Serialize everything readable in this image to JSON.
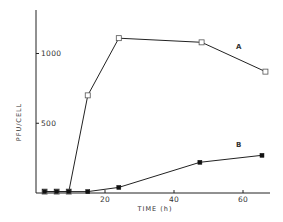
{
  "chart_data": {
    "type": "line",
    "title": "",
    "xlabel": "TIME (h)",
    "ylabel": "PFU/CELL",
    "xlim": [
      0,
      70
    ],
    "ylim": [
      0,
      1200
    ],
    "xticks": [
      20,
      40,
      60
    ],
    "xtick_labels": [
      "20",
      "40",
      "60"
    ],
    "yticks": [
      500,
      1000
    ],
    "ytick_labels": [
      "500",
      "1000"
    ],
    "grid": false,
    "legend": "inline labels",
    "series": [
      {
        "name": "A",
        "marker": "open-square",
        "x": [
          2.5,
          6,
          9.5,
          15,
          24,
          48,
          66.5
        ],
        "y": [
          10,
          10,
          10,
          700,
          1110,
          1080,
          870
        ]
      },
      {
        "name": "B",
        "marker": "filled-square",
        "x": [
          2.5,
          6,
          9.5,
          15,
          24,
          47.5,
          65.5
        ],
        "y": [
          10,
          10,
          10,
          10,
          40,
          220,
          270
        ]
      }
    ],
    "annotations": [
      {
        "text": "A",
        "x": 58,
        "y": 1030
      },
      {
        "text": "B",
        "x": 58,
        "y": 330
      }
    ]
  }
}
